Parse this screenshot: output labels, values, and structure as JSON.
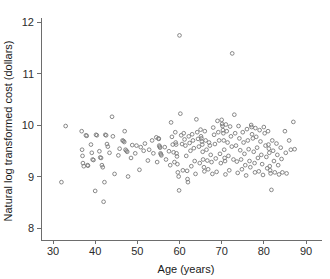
{
  "chart_data": {
    "type": "scatter",
    "title": "",
    "xlabel": "Age (years)",
    "ylabel": "Natural log transformed cost (dollars)",
    "xlim": [
      27,
      93
    ],
    "ylim": [
      7.7,
      12.2
    ],
    "xticks": [
      30,
      40,
      50,
      60,
      70,
      80,
      90
    ],
    "yticks": [
      8,
      9,
      10,
      11,
      12
    ],
    "grid": false,
    "legend": null,
    "marker": "open-circle",
    "marker_color": "#7a7a7a",
    "points": [
      [
        32.0,
        8.89
      ],
      [
        33.0,
        9.98
      ],
      [
        36.8,
        9.88
      ],
      [
        36.9,
        9.52
      ],
      [
        37.0,
        9.4
      ],
      [
        37.1,
        9.26
      ],
      [
        37.3,
        9.2
      ],
      [
        37.8,
        9.8
      ],
      [
        38.0,
        9.79
      ],
      [
        38.2,
        9.22
      ],
      [
        38.3,
        9.21
      ],
      [
        39.0,
        9.62
      ],
      [
        39.2,
        9.46
      ],
      [
        39.4,
        9.33
      ],
      [
        39.6,
        9.32
      ],
      [
        40.0,
        8.72
      ],
      [
        40.2,
        9.81
      ],
      [
        40.4,
        9.8
      ],
      [
        41.0,
        9.49
      ],
      [
        41.2,
        9.37
      ],
      [
        41.4,
        9.36
      ],
      [
        41.6,
        9.22
      ],
      [
        41.8,
        9.18
      ],
      [
        42.0,
        8.51
      ],
      [
        42.2,
        8.89
      ],
      [
        42.4,
        9.81
      ],
      [
        42.6,
        9.8
      ],
      [
        42.8,
        9.63
      ],
      [
        43.0,
        9.58
      ],
      [
        43.4,
        9.46
      ],
      [
        44.0,
        10.16
      ],
      [
        44.2,
        9.78
      ],
      [
        44.6,
        9.05
      ],
      [
        45.5,
        9.41
      ],
      [
        45.8,
        9.54
      ],
      [
        46.5,
        9.7
      ],
      [
        46.7,
        9.69
      ],
      [
        46.9,
        9.67
      ],
      [
        47.0,
        9.88
      ],
      [
        47.2,
        9.52
      ],
      [
        47.4,
        9.5
      ],
      [
        47.6,
        9.48
      ],
      [
        47.8,
        9.0
      ],
      [
        48.5,
        9.36
      ],
      [
        48.8,
        9.61
      ],
      [
        49.5,
        9.45
      ],
      [
        49.8,
        9.6
      ],
      [
        50.5,
        9.13
      ],
      [
        50.8,
        9.57
      ],
      [
        51.5,
        9.5
      ],
      [
        51.8,
        9.64
      ],
      [
        52.5,
        9.31
      ],
      [
        52.8,
        9.52
      ],
      [
        53.5,
        9.7
      ],
      [
        53.8,
        9.45
      ],
      [
        54.5,
        9.76
      ],
      [
        54.7,
        9.28
      ],
      [
        55.0,
        9.74
      ],
      [
        55.1,
        9.73
      ],
      [
        55.2,
        9.6
      ],
      [
        55.3,
        9.58
      ],
      [
        55.4,
        9.56
      ],
      [
        55.5,
        9.45
      ],
      [
        55.6,
        9.43
      ],
      [
        55.7,
        9.41
      ],
      [
        56.5,
        9.57
      ],
      [
        56.8,
        9.33
      ],
      [
        57.5,
        9.49
      ],
      [
        57.8,
        9.22
      ],
      [
        58.0,
        10.05
      ],
      [
        58.2,
        9.77
      ],
      [
        58.4,
        9.62
      ],
      [
        58.6,
        9.47
      ],
      [
        58.8,
        9.28
      ],
      [
        59.0,
        9.86
      ],
      [
        59.1,
        9.66
      ],
      [
        59.2,
        9.62
      ],
      [
        59.3,
        9.45
      ],
      [
        59.4,
        9.39
      ],
      [
        59.5,
        9.24
      ],
      [
        59.6,
        9.08
      ],
      [
        59.8,
        9.0
      ],
      [
        59.9,
        8.73
      ],
      [
        60.0,
        11.74
      ],
      [
        60.2,
        10.22
      ],
      [
        60.4,
        9.8
      ],
      [
        60.6,
        9.63
      ],
      [
        60.8,
        9.12
      ],
      [
        61.0,
        9.84
      ],
      [
        61.2,
        9.72
      ],
      [
        61.4,
        9.6
      ],
      [
        61.6,
        9.4
      ],
      [
        61.8,
        9.11
      ],
      [
        61.9,
        8.95
      ],
      [
        62.0,
        8.89
      ],
      [
        62.2,
        9.78
      ],
      [
        62.4,
        9.65
      ],
      [
        62.6,
        9.5
      ],
      [
        62.8,
        9.2
      ],
      [
        63.0,
        9.82
      ],
      [
        63.2,
        9.7
      ],
      [
        63.4,
        9.55
      ],
      [
        63.6,
        9.3
      ],
      [
        63.8,
        9.05
      ],
      [
        64.0,
        10.11
      ],
      [
        64.2,
        9.86
      ],
      [
        64.4,
        9.73
      ],
      [
        64.6,
        9.58
      ],
      [
        64.8,
        9.26
      ],
      [
        65.0,
        9.91
      ],
      [
        65.1,
        9.78
      ],
      [
        65.2,
        9.74
      ],
      [
        65.3,
        9.68
      ],
      [
        65.4,
        9.62
      ],
      [
        65.5,
        9.48
      ],
      [
        65.6,
        9.33
      ],
      [
        65.8,
        9.18
      ],
      [
        65.9,
        9.1
      ],
      [
        66.0,
        9.88
      ],
      [
        66.2,
        9.7
      ],
      [
        66.4,
        9.52
      ],
      [
        66.6,
        9.31
      ],
      [
        66.8,
        9.14
      ],
      [
        67.0,
        9.66
      ],
      [
        67.2,
        9.6
      ],
      [
        67.4,
        9.42
      ],
      [
        67.6,
        9.28
      ],
      [
        67.8,
        9.05
      ],
      [
        68.0,
        9.95
      ],
      [
        68.2,
        9.81
      ],
      [
        68.4,
        9.63
      ],
      [
        68.6,
        9.35
      ],
      [
        68.8,
        9.09
      ],
      [
        69.0,
        10.08
      ],
      [
        69.2,
        9.86
      ],
      [
        69.4,
        9.7
      ],
      [
        69.6,
        9.44
      ],
      [
        69.8,
        9.26
      ],
      [
        70.0,
        10.1
      ],
      [
        70.1,
        10.02
      ],
      [
        70.2,
        9.98
      ],
      [
        70.3,
        9.9
      ],
      [
        70.4,
        9.84
      ],
      [
        70.5,
        9.7
      ],
      [
        70.6,
        9.52
      ],
      [
        70.7,
        9.36
      ],
      [
        70.8,
        9.3
      ],
      [
        70.9,
        9.04
      ],
      [
        71.0,
        10.01
      ],
      [
        71.2,
        9.88
      ],
      [
        71.4,
        9.66
      ],
      [
        71.6,
        9.4
      ],
      [
        71.8,
        9.12
      ],
      [
        72.0,
        9.97
      ],
      [
        72.2,
        9.78
      ],
      [
        72.4,
        9.58
      ],
      [
        72.5,
        11.39
      ],
      [
        72.8,
        9.33
      ],
      [
        73.0,
        10.2
      ],
      [
        73.2,
        9.84
      ],
      [
        73.4,
        9.6
      ],
      [
        73.6,
        9.29
      ],
      [
        73.8,
        9.07
      ],
      [
        74.0,
        9.98
      ],
      [
        74.2,
        9.74
      ],
      [
        74.4,
        9.51
      ],
      [
        74.6,
        9.33
      ],
      [
        74.8,
        9.14
      ],
      [
        75.0,
        9.86
      ],
      [
        75.2,
        9.66
      ],
      [
        75.4,
        9.44
      ],
      [
        75.6,
        9.22
      ],
      [
        75.8,
        9.02
      ],
      [
        76.0,
        9.92
      ],
      [
        76.2,
        9.7
      ],
      [
        76.4,
        9.53
      ],
      [
        76.6,
        9.3
      ],
      [
        76.8,
        9.18
      ],
      [
        77.0,
        10.0
      ],
      [
        77.1,
        9.96
      ],
      [
        77.2,
        9.82
      ],
      [
        77.4,
        9.74
      ],
      [
        77.6,
        9.48
      ],
      [
        77.8,
        9.26
      ],
      [
        77.9,
        9.08
      ],
      [
        78.0,
        9.94
      ],
      [
        78.2,
        9.77
      ],
      [
        78.4,
        9.56
      ],
      [
        78.6,
        9.36
      ],
      [
        78.8,
        9.1
      ],
      [
        79.0,
        9.9
      ],
      [
        79.2,
        9.68
      ],
      [
        79.4,
        9.42
      ],
      [
        79.6,
        9.24
      ],
      [
        79.8,
        9.03
      ],
      [
        80.0,
        9.96
      ],
      [
        80.2,
        9.84
      ],
      [
        80.4,
        9.6
      ],
      [
        80.6,
        9.38
      ],
      [
        80.8,
        9.16
      ],
      [
        81.0,
        9.88
      ],
      [
        81.1,
        9.62
      ],
      [
        81.2,
        9.54
      ],
      [
        81.3,
        9.46
      ],
      [
        81.4,
        9.2
      ],
      [
        81.5,
        9.12
      ],
      [
        81.6,
        9.06
      ],
      [
        81.8,
        8.74
      ],
      [
        82.0,
        9.7
      ],
      [
        82.2,
        9.5
      ],
      [
        82.4,
        9.3
      ],
      [
        82.6,
        9.08
      ],
      [
        83.0,
        9.64
      ],
      [
        83.2,
        9.42
      ],
      [
        83.4,
        9.22
      ],
      [
        83.6,
        9.04
      ],
      [
        84.0,
        9.56
      ],
      [
        84.2,
        9.34
      ],
      [
        84.4,
        9.08
      ],
      [
        85.0,
        9.88
      ],
      [
        85.2,
        9.46
      ],
      [
        85.4,
        9.06
      ],
      [
        86.0,
        9.7
      ],
      [
        86.4,
        9.52
      ],
      [
        87.0,
        10.06
      ],
      [
        87.3,
        9.53
      ]
    ]
  }
}
